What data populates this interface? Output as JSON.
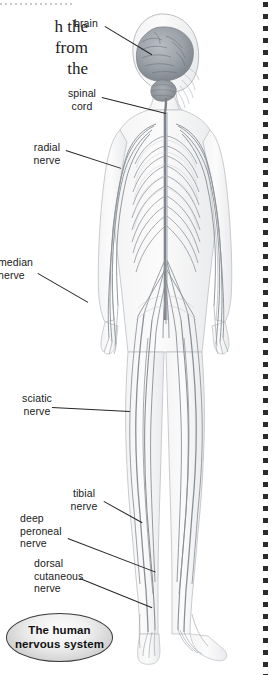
{
  "page": {
    "background_color": "#ffffff",
    "width": 273,
    "height": 675
  },
  "body_text_fragment": {
    "line1": "h the",
    "line2": "from",
    "line3": "the"
  },
  "figure": {
    "view": "posterior full-body figure with brain cutaway",
    "line_color": "#8b8f96",
    "brain_color": "#9aa0a6"
  },
  "labels": [
    {
      "id": "brain",
      "text": "brain",
      "align": "center"
    },
    {
      "id": "spinal-cord",
      "text": "spinal\ncord",
      "align": "center"
    },
    {
      "id": "radial-nerve",
      "text": "radial\nnerve",
      "align": "center"
    },
    {
      "id": "median-nerve",
      "text": "median\nnerve",
      "align": "left"
    },
    {
      "id": "sciatic-nerve",
      "text": "sciatic\nnerve",
      "align": "center"
    },
    {
      "id": "tibial-nerve",
      "text": "tibial\nnerve",
      "align": "center"
    },
    {
      "id": "deep-peroneal",
      "text": "deep\nperoneal\nnerve",
      "align": "left"
    },
    {
      "id": "dorsal-cutaneous",
      "text": "dorsal\ncutaneous\nnerve",
      "align": "left"
    }
  ],
  "caption": {
    "text": "The human\nnervous system",
    "border_color": "#3a3a3a"
  },
  "decor": {
    "top_rule": "dotted-rule",
    "right_margin": "vertical-dot-column",
    "dot_color": "#2b2b2b"
  }
}
